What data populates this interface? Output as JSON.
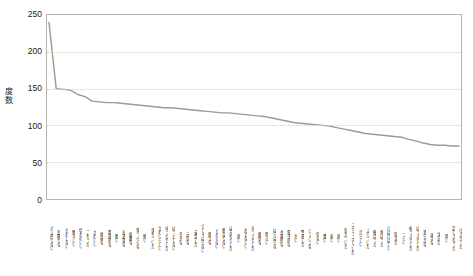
{
  "chart_data": {
    "type": "line",
    "title": "",
    "xlabel": "",
    "ylabel": "度数",
    "ylim": [
      0,
      250
    ],
    "ytick_labels": [
      "250",
      "200",
      "150",
      "100",
      "50",
      "0"
    ],
    "ytick_values": [
      250,
      200,
      150,
      100,
      50,
      0
    ],
    "grid": true,
    "grid_axis": "y",
    "legend": false,
    "line_color": "#9b9b8f",
    "line_width": 1.4,
    "categories": [
      "人工的でない",
      "耳障りな",
      "せわしない",
      "騒々しい",
      "切れのいい",
      "こもった",
      "かわいい",
      "地味な",
      "開放的な",
      "粗い",
      "お洒落な",
      "綺麗な",
      "薄っぺらな",
      "軽い",
      "落ちついた",
      "かわいらしい",
      "ゆったりした",
      "ぱっとしない",
      "平凡な",
      "元気な",
      "安定した",
      "でしゃばらない",
      "静かな",
      "くどくない",
      "物足りない",
      "ぼんやりした",
      "鋭い",
      "おとなしい",
      "あっさりした",
      "軽快な",
      "明るい",
      "ばらばらな",
      "金属的な",
      "電子的な",
      "甘い",
      "警戒した",
      "バラバラな",
      "切ない",
      "重い",
      "弱い",
      "鋭い",
      "気がついた",
      "ゴチャゴチャした",
      "汚らしい",
      "ふらついた",
      "細ばった",
      "角ばった",
      "けばけばしい",
      "狂えた",
      "つらい",
      "帖っきりした",
      "はっきりした",
      "滑らかな",
      "派手な",
      "沈んだ",
      "暗い",
      "話しさなった",
      "小さかった"
    ],
    "values": [
      240,
      150,
      149,
      148,
      142,
      139,
      133,
      132,
      131,
      131,
      130,
      129,
      128,
      127,
      126,
      125,
      124,
      124,
      123,
      122,
      121,
      120,
      119,
      118,
      117,
      117,
      116,
      115,
      114,
      113,
      112,
      110,
      108,
      106,
      104,
      103,
      102,
      101,
      100,
      99,
      97,
      95,
      93,
      91,
      89,
      88,
      87,
      86,
      85,
      84,
      81,
      79,
      76,
      74,
      73,
      73,
      72,
      72
    ]
  },
  "axes": {
    "y_title": "度数"
  }
}
